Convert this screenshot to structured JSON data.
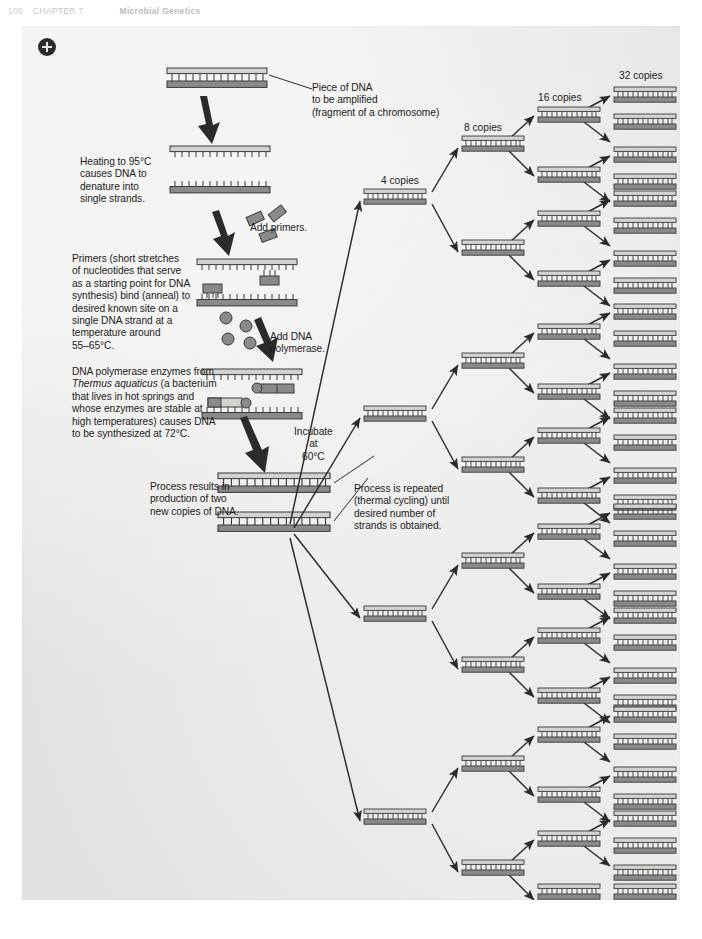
{
  "page_header": {
    "page_number": "106",
    "chapter": "CHAPTER 7",
    "chapter_title": "Microbial Genetics"
  },
  "toolbar": {
    "zoom_in_label": "+"
  },
  "figure": {
    "callouts": [
      {
        "id": "piece-of-dna",
        "text": "Piece of DNA\n    to be amplified\n(fragment of a chromosome)",
        "x": 290,
        "y": 56
      },
      {
        "id": "heating-denature",
        "text": "Heating to 95°C\ncauses DNA to\ndenature into\nsingle strands.",
        "x": 58,
        "y": 130
      },
      {
        "id": "add-primers",
        "text": "Add primers.",
        "x": 228,
        "y": 196
      },
      {
        "id": "primers-anneal",
        "text": "Primers (short stretches\nof nucleotides that serve\nas a starting point for DNA\nsynthesis) bind (anneal) to\ndesired known site on a\nsingle DNA strand at a\ntemperature around\n55–65°C.",
        "x": 50,
        "y": 227
      },
      {
        "id": "add-dna-polymerase",
        "text": "Add DNA\npolymerase.",
        "x": 248,
        "y": 305
      },
      {
        "id": "taq-polymerase",
        "text": "DNA polymerase enzymes from\nThermus aquaticus (a bacterium\nthat lives in hot springs and\nwhose enzymes are stable at\nhigh temperatures) causes DNA\nto be synthesized at 72°C.",
        "x": 50,
        "y": 340
      },
      {
        "id": "incubate-at-60",
        "text": "Incubate\nat\n60°C",
        "x": 272,
        "y": 400
      },
      {
        "id": "process-results",
        "text": "Process results in\nproduction of two\nnew copies of DNA.",
        "x": 128,
        "y": 455
      },
      {
        "id": "process-repeated",
        "text": "Process is repeated\n(thermal cycling) until\ndesired number of\nstrands is obtained.",
        "x": 332,
        "y": 457
      }
    ],
    "copy_labels": [
      {
        "id": "copies-4",
        "text": "4 copies",
        "x": 359,
        "y": 156
      },
      {
        "id": "copies-8",
        "text": "8 copies",
        "x": 439,
        "y": 105
      },
      {
        "id": "copies-16",
        "text": "16 copies",
        "x": 518,
        "y": 77
      },
      {
        "id": "copies-32",
        "text": "32 copies",
        "x": 602,
        "y": 60
      }
    ],
    "italic_term": "Thermus aquaticus",
    "colors": {
      "plate_background": "#e7e7e5",
      "strand_dark": "#7b7b7b",
      "strand_light": "#d2d2cf",
      "outline": "#2b2b2b",
      "arrow": "#2b2b2b",
      "text": "#1c1c1c"
    },
    "temperatures": {
      "denature": "95°C",
      "anneal": "55–65°C",
      "extension": "72°C",
      "incubate": "60°C"
    },
    "cycle_counts": [
      4,
      8,
      16,
      32
    ]
  }
}
